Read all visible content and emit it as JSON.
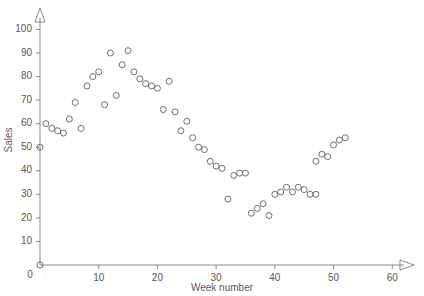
{
  "chart_data": {
    "type": "scatter",
    "title": "",
    "xlabel": "Week number",
    "ylabel": "Sales",
    "xlim": [
      0,
      62
    ],
    "ylim": [
      0,
      104
    ],
    "grid": false,
    "legend": null,
    "origin_label": "0",
    "xticks": [
      10,
      20,
      30,
      40,
      50,
      60
    ],
    "yticks": [
      10,
      20,
      30,
      40,
      50,
      60,
      70,
      80,
      90,
      100
    ],
    "marker": "open-circle",
    "marker_color": "#6e6e7a",
    "axis_color": "#8a8a8a",
    "points": [
      {
        "x": 0,
        "y": 0
      },
      {
        "x": 0,
        "y": 50
      },
      {
        "x": 1,
        "y": 60
      },
      {
        "x": 2,
        "y": 58
      },
      {
        "x": 3,
        "y": 57
      },
      {
        "x": 4,
        "y": 56
      },
      {
        "x": 5,
        "y": 62
      },
      {
        "x": 6,
        "y": 69
      },
      {
        "x": 7,
        "y": 58
      },
      {
        "x": 8,
        "y": 76
      },
      {
        "x": 9,
        "y": 80
      },
      {
        "x": 10,
        "y": 82
      },
      {
        "x": 11,
        "y": 68
      },
      {
        "x": 12,
        "y": 90
      },
      {
        "x": 13,
        "y": 72
      },
      {
        "x": 14,
        "y": 85
      },
      {
        "x": 15,
        "y": 91
      },
      {
        "x": 16,
        "y": 82
      },
      {
        "x": 17,
        "y": 79
      },
      {
        "x": 18,
        "y": 77
      },
      {
        "x": 19,
        "y": 76
      },
      {
        "x": 20,
        "y": 75
      },
      {
        "x": 21,
        "y": 66
      },
      {
        "x": 22,
        "y": 78
      },
      {
        "x": 23,
        "y": 65
      },
      {
        "x": 24,
        "y": 57
      },
      {
        "x": 25,
        "y": 61
      },
      {
        "x": 26,
        "y": 54
      },
      {
        "x": 27,
        "y": 50
      },
      {
        "x": 28,
        "y": 49
      },
      {
        "x": 29,
        "y": 44
      },
      {
        "x": 30,
        "y": 42
      },
      {
        "x": 31,
        "y": 41
      },
      {
        "x": 32,
        "y": 28
      },
      {
        "x": 33,
        "y": 38
      },
      {
        "x": 34,
        "y": 39
      },
      {
        "x": 35,
        "y": 39
      },
      {
        "x": 36,
        "y": 22
      },
      {
        "x": 37,
        "y": 24
      },
      {
        "x": 38,
        "y": 26
      },
      {
        "x": 39,
        "y": 21
      },
      {
        "x": 40,
        "y": 30
      },
      {
        "x": 41,
        "y": 31
      },
      {
        "x": 42,
        "y": 33
      },
      {
        "x": 43,
        "y": 31
      },
      {
        "x": 44,
        "y": 33
      },
      {
        "x": 45,
        "y": 32
      },
      {
        "x": 46,
        "y": 30
      },
      {
        "x": 47,
        "y": 30
      },
      {
        "x": 47,
        "y": 44
      },
      {
        "x": 48,
        "y": 47
      },
      {
        "x": 49,
        "y": 46
      },
      {
        "x": 50,
        "y": 51
      },
      {
        "x": 51,
        "y": 53
      },
      {
        "x": 52,
        "y": 54
      }
    ]
  }
}
